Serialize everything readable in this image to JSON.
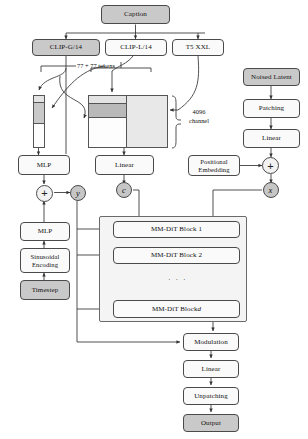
{
  "diagram": {
    "colors": {
      "box_fill_light": "#f2f2f2",
      "box_fill_dark": "#c9c9c9",
      "box_fill_white": "#fafafa",
      "stroke": "#4a4a4a",
      "tensor_top": "#e3e3e3",
      "tensor_band": "#b9b9b9",
      "tensor_body": "#fdfdfd",
      "tensor_right": "#e8e8e8",
      "group_fill": "#f4f4f4"
    },
    "text_nodes": {
      "caption": "Caption",
      "clip_g": "CLIP-G/14",
      "clip_l": "CLIP-L/14",
      "t5": "T5 XXL",
      "mlp_text": "MLP",
      "linear_text": "Linear",
      "positional_embedding_l1": "Positional",
      "positional_embedding_l2": "Embedding",
      "noised_latent": "Noised Latent",
      "patching": "Patching",
      "linear_latent": "Linear",
      "mlp_time": "MLP",
      "sinusoidal_l1": "Sinusoidal",
      "sinusoidal_l2": "Encoding",
      "timestep": "Timestep",
      "block_1": "MM-DiT Block 1",
      "block_2": "MM-DiT Block 2",
      "block_d_prefix": "MM-DiT Block ",
      "block_d_index": "d",
      "block_ellipsis": "· · ·",
      "modulation": "Modulation",
      "linear_out": "Linear",
      "unpatching": "Unpatching",
      "output": "Output"
    },
    "circles": {
      "sum_text": "+",
      "y_symbol": "y",
      "c_symbol": "c",
      "sum_latent": "+",
      "x_symbol": "x"
    },
    "annotations": {
      "tokens": "77 + 77 tokens",
      "channel_l1": "4096",
      "channel_l2": "channel"
    }
  }
}
